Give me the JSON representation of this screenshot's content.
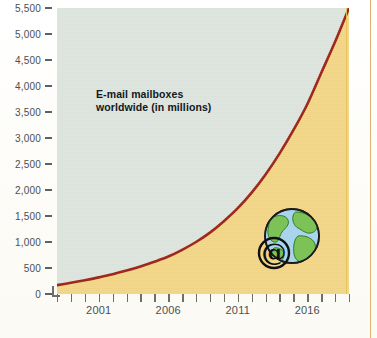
{
  "figure": {
    "background_color": "#fdfcf8",
    "plot_background_color": "#dde5de",
    "area_fill_color": "#f2d78a",
    "line_color": "#9e2418",
    "page_rule_color": "#d8a45c"
  },
  "title": {
    "line1": "E-mail mailboxes",
    "line2": "worldwide (in millions)"
  },
  "y_axis": {
    "labels": [
      "5,500",
      "5,000",
      "4,500",
      "4,000",
      "3,500",
      "3,000",
      "2,500",
      "2,000",
      "1,500",
      "1,000",
      "500",
      "0"
    ]
  },
  "x_axis": {
    "labels": [
      "2001",
      "2006",
      "2011",
      "2016"
    ]
  },
  "globe": {
    "icon_name": "globe-at-symbol-icon",
    "ocean_color": "#a9d4ec",
    "land_color": "#7cc257",
    "at_symbol": "@"
  },
  "chart_data": {
    "type": "area",
    "title": "E-mail mailboxes worldwide (in millions)",
    "xlabel": "",
    "ylabel": "millions",
    "xlim": [
      1998,
      2019
    ],
    "ylim": [
      0,
      5500
    ],
    "ytick_values": [
      0,
      500,
      1000,
      1500,
      2000,
      2500,
      3000,
      3500,
      4000,
      4500,
      5000,
      5500
    ],
    "xtick_values": [
      1998,
      1999,
      2000,
      2001,
      2002,
      2003,
      2004,
      2005,
      2006,
      2007,
      2008,
      2009,
      2010,
      2011,
      2012,
      2013,
      2014,
      2015,
      2016,
      2017,
      2018,
      2019
    ],
    "xtick_labeled": [
      2001,
      2006,
      2011,
      2016
    ],
    "grid": false,
    "legend": null,
    "series": [
      {
        "name": "E-mail mailboxes worldwide (in millions)",
        "x": [
          1998,
          1999,
          2000,
          2001,
          2002,
          2003,
          2004,
          2005,
          2006,
          2007,
          2008,
          2009,
          2010,
          2011,
          2012,
          2013,
          2014,
          2015,
          2016,
          2017,
          2018,
          2019
        ],
        "values": [
          170,
          215,
          265,
          320,
          380,
          450,
          530,
          620,
          720,
          850,
          1000,
          1180,
          1400,
          1650,
          1950,
          2300,
          2700,
          3150,
          3650,
          4250,
          4850,
          5500
        ]
      }
    ]
  }
}
